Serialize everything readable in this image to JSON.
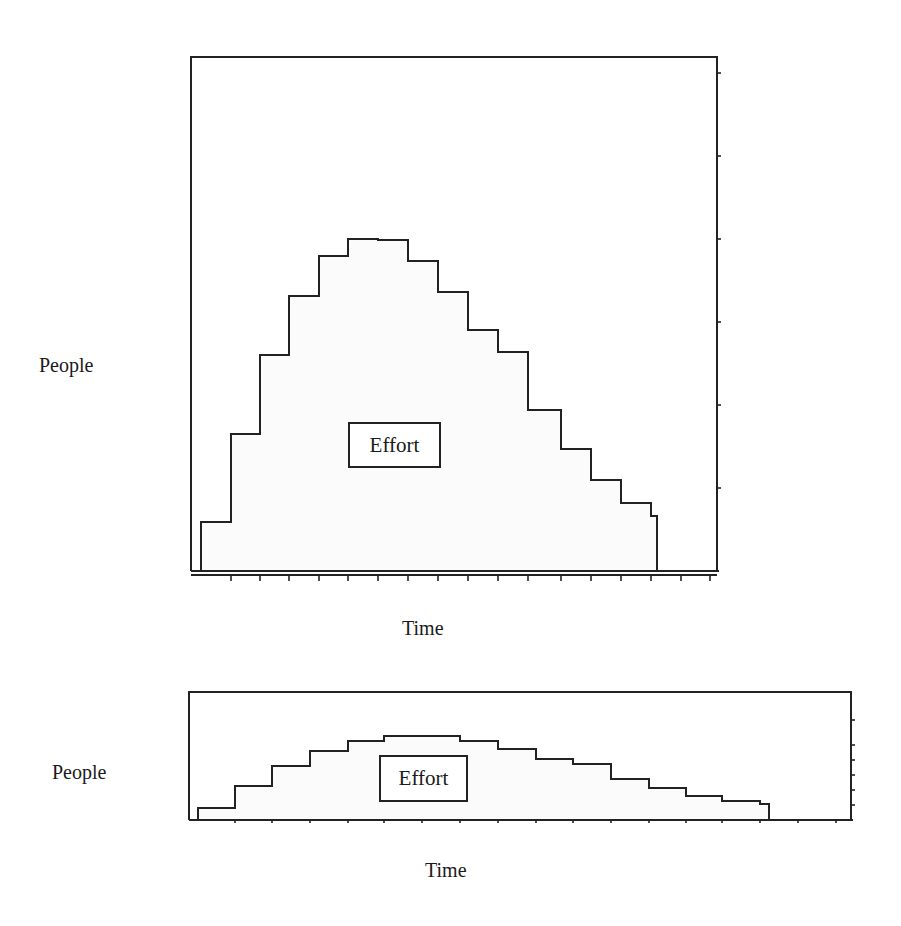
{
  "chart_data": [
    {
      "type": "area",
      "subtype": "step",
      "title": "",
      "xlabel": "Time",
      "ylabel": "People",
      "annotation": "Effort",
      "grid": false,
      "legend": "none",
      "x_ticks": 17,
      "y_ticks": 6,
      "x": [
        1,
        2,
        3,
        4,
        5,
        6,
        7,
        8,
        9,
        10,
        11,
        12,
        13,
        14,
        15,
        16
      ],
      "values": [
        0.6,
        1.65,
        2.6,
        3.3,
        3.8,
        4.0,
        4.0,
        3.75,
        3.35,
        2.9,
        2.65,
        1.95,
        1.45,
        1.1,
        0.8,
        0.65
      ],
      "ylim": [
        0,
        6
      ],
      "layout": {
        "frame": {
          "x": 191,
          "y": 57,
          "w": 526,
          "h": 514
        },
        "baseline": 571,
        "axis2": 575,
        "px_per_unit": 83,
        "steps_x": [
          201,
          231,
          260,
          289,
          319,
          348,
          378,
          408,
          438,
          468,
          498,
          528,
          561,
          591,
          621,
          651,
          657
        ],
        "steps_y": [
          522,
          434,
          355,
          296,
          256,
          239,
          240,
          261,
          292,
          330,
          352,
          410,
          449,
          480,
          503,
          516
        ],
        "tick_x": [
          231,
          260,
          289,
          319,
          348,
          378,
          408,
          438,
          468,
          498,
          528,
          561,
          591,
          621,
          651,
          681,
          710
        ],
        "tick_y": [
          488,
          405,
          322,
          239,
          156,
          73
        ],
        "effort_box": {
          "x": 348,
          "y": 422,
          "w": 93,
          "h": 46
        },
        "ylabel_pos": {
          "x": 39,
          "y": 355
        },
        "xlabel_pos": {
          "x": 402,
          "y": 618
        }
      }
    },
    {
      "type": "area",
      "subtype": "step",
      "title": "",
      "xlabel": "Time",
      "ylabel": "People",
      "annotation": "Effort",
      "grid": false,
      "legend": "none",
      "x_ticks": 17,
      "y_ticks": 6,
      "x": [
        1,
        2,
        3,
        4,
        5,
        6,
        7,
        8,
        9,
        10,
        11,
        12,
        13,
        14,
        15
      ],
      "values": [
        1.0,
        2.7,
        4.2,
        5.4,
        6.2,
        6.5,
        6.2,
        5.6,
        4.8,
        4.4,
        3.2,
        2.5,
        1.9,
        1.5,
        1.3
      ],
      "ylim": [
        0,
        10
      ],
      "layout": {
        "frame": {
          "x": 189,
          "y": 692,
          "w": 662,
          "h": 129
        },
        "baseline": 820,
        "axis2": 820,
        "steps_x": [
          198,
          235,
          272,
          310,
          348,
          384,
          460,
          498,
          536,
          573,
          611,
          649,
          686,
          722,
          760,
          769
        ],
        "steps_y": [
          808,
          786,
          766,
          751,
          741,
          736,
          741,
          749,
          759,
          764,
          779,
          788,
          796,
          801,
          804
        ],
        "tick_x": [
          235,
          272,
          310,
          348,
          384,
          422,
          460,
          498,
          536,
          573,
          611,
          649,
          686,
          722,
          760,
          798,
          836
        ],
        "tick_y": [
          805,
          790,
          775,
          760,
          745,
          720
        ],
        "effort_box": {
          "x": 379,
          "y": 755,
          "w": 89,
          "h": 47
        },
        "ylabel_pos": {
          "x": 52,
          "y": 762
        },
        "xlabel_pos": {
          "x": 425,
          "y": 860
        }
      }
    }
  ],
  "charts": [
    {
      "ylabel": "People",
      "xlabel": "Time",
      "annotation": "Effort"
    },
    {
      "ylabel": "People",
      "xlabel": "Time",
      "annotation": "Effort"
    }
  ]
}
